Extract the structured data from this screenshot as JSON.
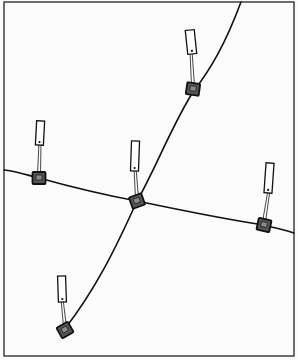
{
  "diagram": {
    "colors": {
      "background": "#fbfbfb",
      "frame": "#333333",
      "line": "#111111",
      "box_fill": "#555555",
      "tag_fill": "#ffffff"
    },
    "frame": {
      "x": 4,
      "y": 2,
      "width": 290,
      "height": 354
    },
    "lines": [
      {
        "id": "line-a",
        "path": "M241,2 C225,45 210,70 193,92 C172,125 155,170 137,201 C115,250 95,290 64,330"
      },
      {
        "id": "line-b",
        "path": "M4,170 C20,172 30,176 39,178 C75,188 110,196 137,201 C180,210 230,220 264,225 C275,228 285,230 294,233"
      }
    ],
    "nodes": [
      {
        "id": "node-top-right",
        "box": {
          "x": 193,
          "y": 89,
          "rot": 8
        },
        "tag": {
          "x": 191,
          "y": 42,
          "w": 9,
          "h": 24,
          "rot": -6
        }
      },
      {
        "id": "node-left",
        "box": {
          "x": 39,
          "y": 178,
          "rot": 0
        },
        "tag": {
          "x": 40,
          "y": 133,
          "w": 8,
          "h": 24,
          "rot": 3
        }
      },
      {
        "id": "node-center",
        "box": {
          "x": 137,
          "y": 201,
          "rot": -20
        },
        "tag": {
          "x": 135,
          "y": 156,
          "w": 8,
          "h": 30,
          "rot": 2
        }
      },
      {
        "id": "node-right",
        "box": {
          "x": 264,
          "y": 225,
          "rot": 12
        },
        "tag": {
          "x": 269,
          "y": 178,
          "w": 8,
          "h": 30,
          "rot": 4
        }
      },
      {
        "id": "node-bottom",
        "box": {
          "x": 65,
          "y": 330,
          "rot": -30
        },
        "tag": {
          "x": 62,
          "y": 289,
          "w": 8,
          "h": 26,
          "rot": -2
        }
      }
    ]
  }
}
